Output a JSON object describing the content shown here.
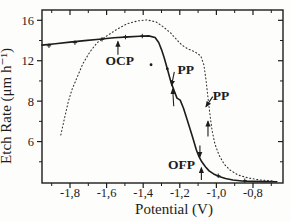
{
  "figure": {
    "background": "#fdfdfb",
    "ink": "#1c1c1c",
    "dotted_ink": "#333333"
  },
  "chart_data": {
    "type": "line",
    "title": "",
    "xlabel": "Potential (V)",
    "ylabel": "Etch Rate (μm h⁻¹)",
    "grid": false,
    "legend": "none",
    "x_axis": {
      "min": -1.953,
      "max": -0.636,
      "tick_labels": [
        "-1,8",
        "-1,6",
        "-1,4",
        "-1,2",
        "-1,0",
        "-0,8"
      ],
      "tick_values": [
        -1.8,
        -1.6,
        -1.4,
        -1.2,
        -1.0,
        -0.8
      ],
      "minor_tick_values": [
        -1.9,
        -1.7,
        -1.5,
        -1.3,
        -1.1,
        -0.9,
        -0.7
      ]
    },
    "y_axis": {
      "min": -0.1,
      "max": 17.02,
      "tick_labels": [
        "16",
        "12",
        "8",
        "6"
      ],
      "tick_values": [
        16,
        12,
        8,
        4
      ],
      "minor_tick_values": [
        14,
        10,
        6,
        2
      ]
    },
    "series": [
      {
        "name": "etch-rate-solid-curve",
        "style": "solid",
        "points": [
          [
            -1.953,
            13.55
          ],
          [
            -1.88,
            13.68
          ],
          [
            -1.8,
            13.84
          ],
          [
            -1.72,
            13.99
          ],
          [
            -1.64,
            14.13
          ],
          [
            -1.56,
            14.27
          ],
          [
            -1.48,
            14.36
          ],
          [
            -1.42,
            14.43
          ],
          [
            -1.37,
            14.46
          ],
          [
            -1.335,
            14.3
          ],
          [
            -1.315,
            13.8
          ],
          [
            -1.3,
            13.1
          ],
          [
            -1.285,
            12.3
          ],
          [
            -1.268,
            11.2
          ],
          [
            -1.25,
            10.0
          ],
          [
            -1.232,
            9.1
          ],
          [
            -1.215,
            8.3
          ],
          [
            -1.198,
            8.1
          ],
          [
            -1.18,
            7.3
          ],
          [
            -1.162,
            6.3
          ],
          [
            -1.145,
            5.3
          ],
          [
            -1.128,
            4.3
          ],
          [
            -1.11,
            3.2
          ],
          [
            -1.095,
            2.5
          ],
          [
            -1.08,
            2.0
          ],
          [
            -1.06,
            1.5
          ],
          [
            -1.04,
            1.1
          ],
          [
            -1.015,
            0.8
          ],
          [
            -0.985,
            0.55
          ],
          [
            -0.95,
            0.35
          ],
          [
            -0.91,
            0.2
          ],
          [
            -0.86,
            0.1
          ],
          [
            -0.8,
            0.06
          ],
          [
            -0.73,
            0.04
          ],
          [
            -0.67,
            0.03
          ]
        ]
      },
      {
        "name": "etch-rate-dotted-curve",
        "style": "dotted",
        "points": [
          [
            -1.85,
            4.65
          ],
          [
            -1.83,
            6.3
          ],
          [
            -1.81,
            7.9
          ],
          [
            -1.79,
            9.1
          ],
          [
            -1.76,
            10.4
          ],
          [
            -1.73,
            11.7
          ],
          [
            -1.69,
            12.9
          ],
          [
            -1.65,
            13.8
          ],
          [
            -1.6,
            14.45
          ],
          [
            -1.54,
            15.15
          ],
          [
            -1.49,
            15.64
          ],
          [
            -1.43,
            15.94
          ],
          [
            -1.38,
            16.04
          ],
          [
            -1.33,
            15.84
          ],
          [
            -1.29,
            15.35
          ],
          [
            -1.25,
            14.75
          ],
          [
            -1.216,
            14.06
          ],
          [
            -1.189,
            13.56
          ],
          [
            -1.156,
            13.17
          ],
          [
            -1.117,
            12.87
          ],
          [
            -1.085,
            12.48
          ],
          [
            -1.068,
            11.58
          ],
          [
            -1.057,
            10.1
          ],
          [
            -1.046,
            8.32
          ],
          [
            -1.035,
            6.63
          ],
          [
            -1.024,
            5.15
          ],
          [
            -1.008,
            3.76
          ],
          [
            -0.986,
            2.67
          ],
          [
            -0.958,
            1.78
          ],
          [
            -0.926,
            1.19
          ],
          [
            -0.882,
            0.69
          ],
          [
            -0.827,
            0.4
          ],
          [
            -0.762,
            0.2
          ],
          [
            -0.685,
            0.1
          ]
        ]
      }
    ],
    "markers": {
      "plus_points": [
        [
          -1.915,
          13.48
        ],
        [
          -1.773,
          13.79
        ],
        [
          -1.625,
          14.12
        ],
        [
          -1.497,
          14.34
        ],
        [
          -1.405,
          14.44
        ],
        [
          -0.99,
          0.62
        ],
        [
          -0.845,
          0.13
        ]
      ],
      "dot_points": [
        [
          -1.268,
          11.2
        ],
        [
          -1.357,
          11.6
        ]
      ]
    },
    "annotations": [
      {
        "text": "OCP",
        "tx": -1.528,
        "ty": 12.0,
        "arrows": [
          {
            "x1": -1.538,
            "y1": 12.6,
            "x2": -1.538,
            "y2": 13.9
          }
        ]
      },
      {
        "text": "PP",
        "tx": -1.168,
        "ty": 11.15,
        "arrows": [
          {
            "x1": -1.23,
            "y1": 10.9,
            "x2": -1.245,
            "y2": 9.55
          },
          {
            "x1": -1.233,
            "y1": 7.5,
            "x2": -1.239,
            "y2": 9.2
          }
        ]
      },
      {
        "text": "PP",
        "tx": -0.975,
        "ty": 8.55,
        "arrows": [
          {
            "x1": -1.02,
            "y1": 8.45,
            "x2": -1.057,
            "y2": 7.45
          },
          {
            "x1": -1.046,
            "y1": 4.5,
            "x2": -1.046,
            "y2": 6.0
          }
        ]
      },
      {
        "text": "OFP",
        "tx": -1.19,
        "ty": 1.75,
        "arrows": [
          {
            "x1": -1.09,
            "y1": 3.6,
            "x2": -1.09,
            "y2": 2.5
          },
          {
            "x1": -1.082,
            "y1": 0.2,
            "x2": -1.082,
            "y2": 1.4
          }
        ]
      }
    ]
  }
}
